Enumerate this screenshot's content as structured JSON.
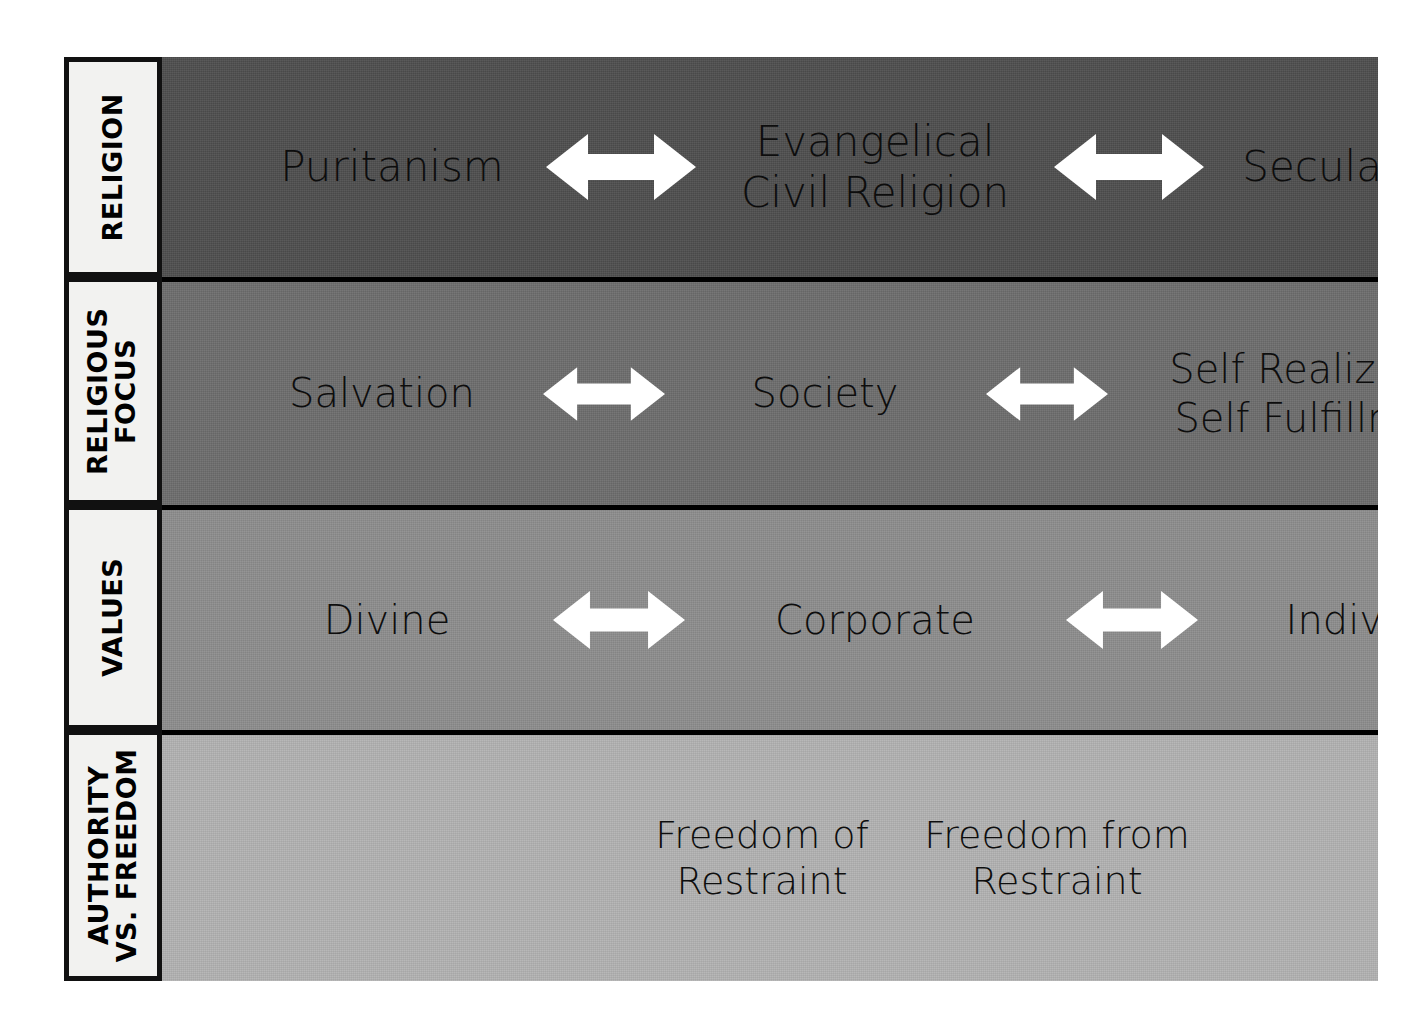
{
  "diagram": {
    "rows": [
      {
        "id": "religion",
        "label": "RELIGION",
        "label_lines": [
          "RELIGION"
        ],
        "background": "#4f4f4f",
        "nodes": [
          {
            "text": "Puritanism"
          },
          {
            "text": "Evangelical\nCivil Religion"
          },
          {
            "text": "Secularism"
          }
        ],
        "arrows": [
          "double-headed-arrow",
          "double-headed-arrow"
        ]
      },
      {
        "id": "religious-focus",
        "label": "RELIGIOUS FOCUS",
        "label_lines": [
          "RELIGIOUS",
          "FOCUS"
        ],
        "background": "#6e6e6e",
        "nodes": [
          {
            "text": "Salvation"
          },
          {
            "text": "Society"
          },
          {
            "text": "Self Realization\nSelf Fulfillment"
          }
        ],
        "arrows": [
          "double-headed-arrow",
          "double-headed-arrow"
        ]
      },
      {
        "id": "values",
        "label": "VALUES",
        "label_lines": [
          "VALUES"
        ],
        "background": "#8e8e8e",
        "nodes": [
          {
            "text": "Divine"
          },
          {
            "text": "Corporate"
          },
          {
            "text": "Individual"
          }
        ],
        "arrows": [
          "double-headed-arrow",
          "double-headed-arrow"
        ]
      },
      {
        "id": "authority-vs-freedom",
        "label": "AUTHORITY VS. FREEDOM",
        "label_lines": [
          "AUTHORITY",
          "VS. FREEDOM"
        ],
        "background": "#b3b3b3",
        "nodes": [
          {
            "text": "Freedom of\nRestraint"
          },
          {
            "text": "Freedom from\nRestraint"
          }
        ],
        "arrows": []
      }
    ],
    "colors": {
      "page_background": "#ffffff",
      "border": "#000000",
      "label_cell_background": "#f2f2f0",
      "label_text": "#000000",
      "node_text": "#0d0d0d",
      "arrow_fill": "#ffffff"
    }
  }
}
